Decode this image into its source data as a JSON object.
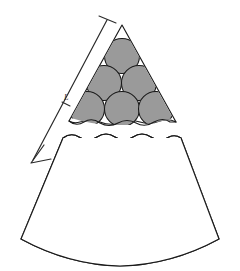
{
  "figure": {
    "background_color": "#ffffff",
    "width": 240,
    "height": 271,
    "outline_color": "#1a1a1a",
    "solid_particle_fill": "#9a9a9a",
    "shell_fill": "#fbfbfb",
    "core_fill": "#9a9a9a"
  },
  "arrow": {
    "name": "gradient-direction-arrow",
    "label": "L",
    "direction": "down-left",
    "has_end_tick": true,
    "has_mid_tick": true,
    "color": "#2a2a2a",
    "start": {
      "x": 108,
      "y": 18
    },
    "end": {
      "x": 32,
      "y": 162
    }
  },
  "break": {
    "name": "wavy-break-line",
    "segments": 2,
    "description": "double wavy line indicating an omitted middle portion of the wedge"
  },
  "upper_wedge": {
    "name": "upper-wedge-section",
    "apex": {
      "x": 122,
      "y": 24
    },
    "rows": [
      {
        "count": 1,
        "type": "solid",
        "radius": 17,
        "cy": 55,
        "cx_start": 122,
        "spacing": 0
      },
      {
        "count": 2,
        "type": "solid",
        "radius": 17,
        "cy": 81,
        "cx_start": 105,
        "spacing": 34
      },
      {
        "count": 3,
        "type": "solid",
        "radius": 17,
        "cy": 107,
        "cx_start": 88,
        "spacing": 34
      }
    ]
  },
  "lower_wedge": {
    "name": "lower-wedge-section",
    "rows": [
      {
        "count": 5,
        "type": "solid",
        "radius": 16.5,
        "cy": 155,
        "cx_start": 54,
        "spacing": 33,
        "core_radius": 0
      },
      {
        "count": 6,
        "type": "shelled",
        "radius": 16.5,
        "cy": 184,
        "cx_start": 42,
        "spacing": 31,
        "core_radius": 9.5
      },
      {
        "count": 6,
        "type": "shelled",
        "radius": 16.0,
        "cy": 211,
        "cx_start": 41,
        "spacing": 31,
        "core_radius": 7.5
      },
      {
        "count": 7,
        "type": "shelled",
        "radius": 15.5,
        "cy": 213,
        "cx_start": 25,
        "spacing": 31,
        "core_radius": 6.5
      },
      {
        "count": 7,
        "type": "shelled",
        "radius": 15.0,
        "cy": 240,
        "cx_start": 28,
        "spacing": 30,
        "core_radius": 4.5
      }
    ]
  },
  "legend": {
    "solid_particle": "large dense particle",
    "shelled_particle": "coated particle with shrinking core"
  }
}
